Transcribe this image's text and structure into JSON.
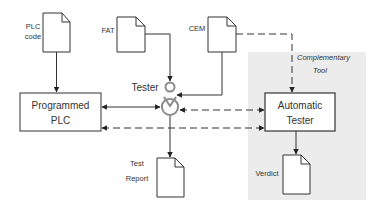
{
  "diagram": {
    "background_color": "#ffffff",
    "highlight_region_color": "#ececec",
    "stroke_color": "#333333",
    "tester_icon_color": "#8a8a8a",
    "documents": {
      "plc_code": {
        "label_line1": "PLC",
        "label_line2": "code"
      },
      "fat": {
        "label": "FAT"
      },
      "cem": {
        "label": "CEM"
      },
      "test_report": {
        "label_line1": "Test",
        "label_line2": "Report"
      },
      "verdict": {
        "label": "Verdict"
      }
    },
    "boxes": {
      "programmed_plc": {
        "label_line1": "Programmed",
        "label_line2": "PLC"
      },
      "automatic_tester": {
        "label_line1": "Automatic",
        "label_line2": "Tester"
      }
    },
    "actor": {
      "label": "Tester"
    },
    "annotation": {
      "line1": "Complementary",
      "line2": "Tool"
    },
    "edges": [
      {
        "from": "PLC code",
        "to": "Programmed PLC",
        "style": "solid"
      },
      {
        "from": "FAT",
        "to": "Tester",
        "style": "solid"
      },
      {
        "from": "CEM",
        "to": "Tester",
        "style": "solid"
      },
      {
        "from": "CEM",
        "to": "Automatic Tester",
        "style": "dashed",
        "label": "Complementary Tool"
      },
      {
        "from": "Programmed PLC",
        "to": "Tester",
        "style": "solid",
        "bidirectional": true
      },
      {
        "from": "Tester",
        "to": "Automatic Tester",
        "style": "dashed",
        "bidirectional": true
      },
      {
        "from": "Programmed PLC",
        "to": "Automatic Tester",
        "style": "dashed",
        "bidirectional": true
      },
      {
        "from": "Tester",
        "to": "Test Report",
        "style": "solid"
      },
      {
        "from": "Automatic Tester",
        "to": "Verdict",
        "style": "solid"
      }
    ]
  }
}
